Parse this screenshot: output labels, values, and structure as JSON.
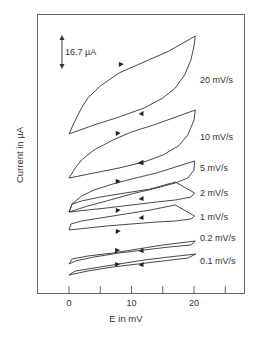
{
  "chart_data": {
    "type": "line",
    "title": "",
    "xlabel": "E in mV",
    "ylabel": "Current in µA",
    "xlim": [
      -5,
      28
    ],
    "x_ticks": [
      0,
      5,
      10,
      15,
      20,
      25
    ],
    "x_tick_labels": [
      "0",
      "10",
      "20"
    ],
    "x_tick_label_values": [
      0,
      10,
      20
    ],
    "grid": false,
    "legend": "none (series labeled inline at right)",
    "scale_bar": {
      "label": "16.7  µA",
      "value_uA": 16.7
    },
    "series": [
      {
        "name": "20 mV/s",
        "label_y": 80,
        "points": [
          [
            0,
            134
          ],
          [
            1,
            120
          ],
          [
            2,
            108
          ],
          [
            3,
            98
          ],
          [
            5,
            86
          ],
          [
            8,
            73
          ],
          [
            12,
            62
          ],
          [
            16,
            51
          ],
          [
            20.2,
            36
          ],
          [
            20,
            46
          ],
          [
            19.5,
            60
          ],
          [
            18.5,
            75
          ],
          [
            17,
            88
          ],
          [
            15,
            98
          ],
          [
            12,
            108
          ],
          [
            8,
            117
          ],
          [
            4,
            125
          ],
          [
            0,
            134
          ]
        ],
        "fwd_arrow": [
          8.3,
          65
        ],
        "rev_arrow": [
          11.6,
          113
        ]
      },
      {
        "name": "10 mV/s",
        "label_y": 137,
        "points": [
          [
            0,
            178
          ],
          [
            1,
            168
          ],
          [
            2,
            160
          ],
          [
            4,
            150
          ],
          [
            7,
            140
          ],
          [
            10,
            132
          ],
          [
            14,
            124
          ],
          [
            20.2,
            110
          ],
          [
            20,
            120
          ],
          [
            19,
            135
          ],
          [
            17.5,
            146
          ],
          [
            15,
            155
          ],
          [
            12,
            162
          ],
          [
            8,
            168
          ],
          [
            4,
            173
          ],
          [
            0,
            178
          ]
        ],
        "fwd_arrow": [
          7.8,
          134
        ],
        "rev_arrow": [
          11.6,
          162
        ]
      },
      {
        "name": "5 mV/s",
        "label_y": 168,
        "points": [
          [
            0,
            212
          ],
          [
            0.5,
            204
          ],
          [
            2,
            196
          ],
          [
            4,
            190
          ],
          [
            7,
            184
          ],
          [
            10,
            179
          ],
          [
            14,
            173
          ],
          [
            20.1,
            161
          ],
          [
            20,
            170
          ],
          [
            19,
            178
          ],
          [
            17,
            183
          ],
          [
            14,
            188
          ],
          [
            10,
            194
          ],
          [
            6,
            201
          ],
          [
            3,
            206
          ],
          [
            0,
            212
          ]
        ],
        "fwd_arrow": [
          7.8,
          182
        ],
        "rev_arrow": [
          11.5,
          162
        ]
      },
      {
        "name": "2 mV/s",
        "label_y": 193,
        "points": [
          [
            0,
            212
          ],
          [
            0.5,
            204
          ],
          [
            2,
            201
          ],
          [
            5,
            197
          ],
          [
            9,
            193
          ],
          [
            13,
            189
          ],
          [
            17,
            182
          ],
          [
            20.1,
            193
          ],
          [
            19.5,
            197
          ],
          [
            17,
            200
          ],
          [
            14,
            202
          ],
          [
            10,
            205
          ],
          [
            6,
            208
          ],
          [
            3,
            210
          ],
          [
            0,
            212
          ]
        ],
        "fwd_arrow": [
          7.8,
          211
        ],
        "rev_arrow": [
          11.6,
          198
        ]
      },
      {
        "name": "1 mV/s",
        "label_y": 217,
        "points": [
          [
            0,
            230
          ],
          [
            0.3,
            224
          ],
          [
            2,
            221
          ],
          [
            5,
            218
          ],
          [
            9,
            214
          ],
          [
            13,
            210
          ],
          [
            17,
            205
          ],
          [
            20.1,
            216
          ],
          [
            19.5,
            219
          ],
          [
            17,
            221
          ],
          [
            14,
            222
          ],
          [
            10,
            224
          ],
          [
            6,
            226
          ],
          [
            3,
            228
          ],
          [
            0,
            230
          ]
        ],
        "fwd_arrow": [
          7.8,
          232
        ],
        "rev_arrow": [
          11.6,
          217
        ]
      },
      {
        "name": "0.2 mV/s",
        "label_y": 238,
        "points": [
          [
            0,
            264
          ],
          [
            0.5,
            259
          ],
          [
            3,
            256
          ],
          [
            7,
            253
          ],
          [
            11,
            249
          ],
          [
            15,
            245
          ],
          [
            20.2,
            241
          ],
          [
            19.5,
            245
          ],
          [
            16,
            247
          ],
          [
            12,
            250
          ],
          [
            8,
            253
          ],
          [
            4,
            257
          ],
          [
            1,
            261
          ],
          [
            0,
            264
          ]
        ],
        "fwd_arrow": [
          7.7,
          251
        ],
        "rev_arrow": [
          11.6,
          250
        ]
      },
      {
        "name": "0.1 mV/s",
        "label_y": 261,
        "points": [
          [
            0,
            275
          ],
          [
            1,
            271
          ],
          [
            4,
            268
          ],
          [
            8,
            264
          ],
          [
            12,
            260
          ],
          [
            16,
            257
          ],
          [
            20.3,
            254
          ],
          [
            19,
            258
          ],
          [
            15,
            261
          ],
          [
            11,
            264
          ],
          [
            7,
            267
          ],
          [
            3,
            271
          ],
          [
            0,
            275
          ]
        ],
        "fwd_arrow": [
          7.7,
          265
        ],
        "rev_arrow": [
          11.6,
          264
        ]
      }
    ]
  }
}
